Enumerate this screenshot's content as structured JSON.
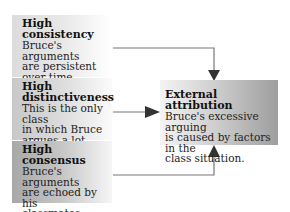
{
  "causes": [
    {
      "title_line1": "High",
      "title_line2": "consistency",
      "body_lines": [
        "Bruce's arguments",
        "are persistent",
        "over time."
      ]
    },
    {
      "title_line1": "High",
      "title_line2": "distinctiveness",
      "body_lines": [
        "This is the only class",
        "in which Bruce",
        "argues a lot."
      ]
    },
    {
      "title_line1": "High",
      "title_line2": "consensus",
      "body_lines": [
        "Bruce's arguments",
        "are echoed by his",
        "classmates."
      ]
    }
  ],
  "effect": {
    "title": "External attribution",
    "body_lines": [
      "Bruce's excessive arguing",
      "is caused by factors in the",
      "class situation."
    ]
  },
  "colors": {
    "connector": "#777777",
    "arrowhead": "#333333"
  }
}
